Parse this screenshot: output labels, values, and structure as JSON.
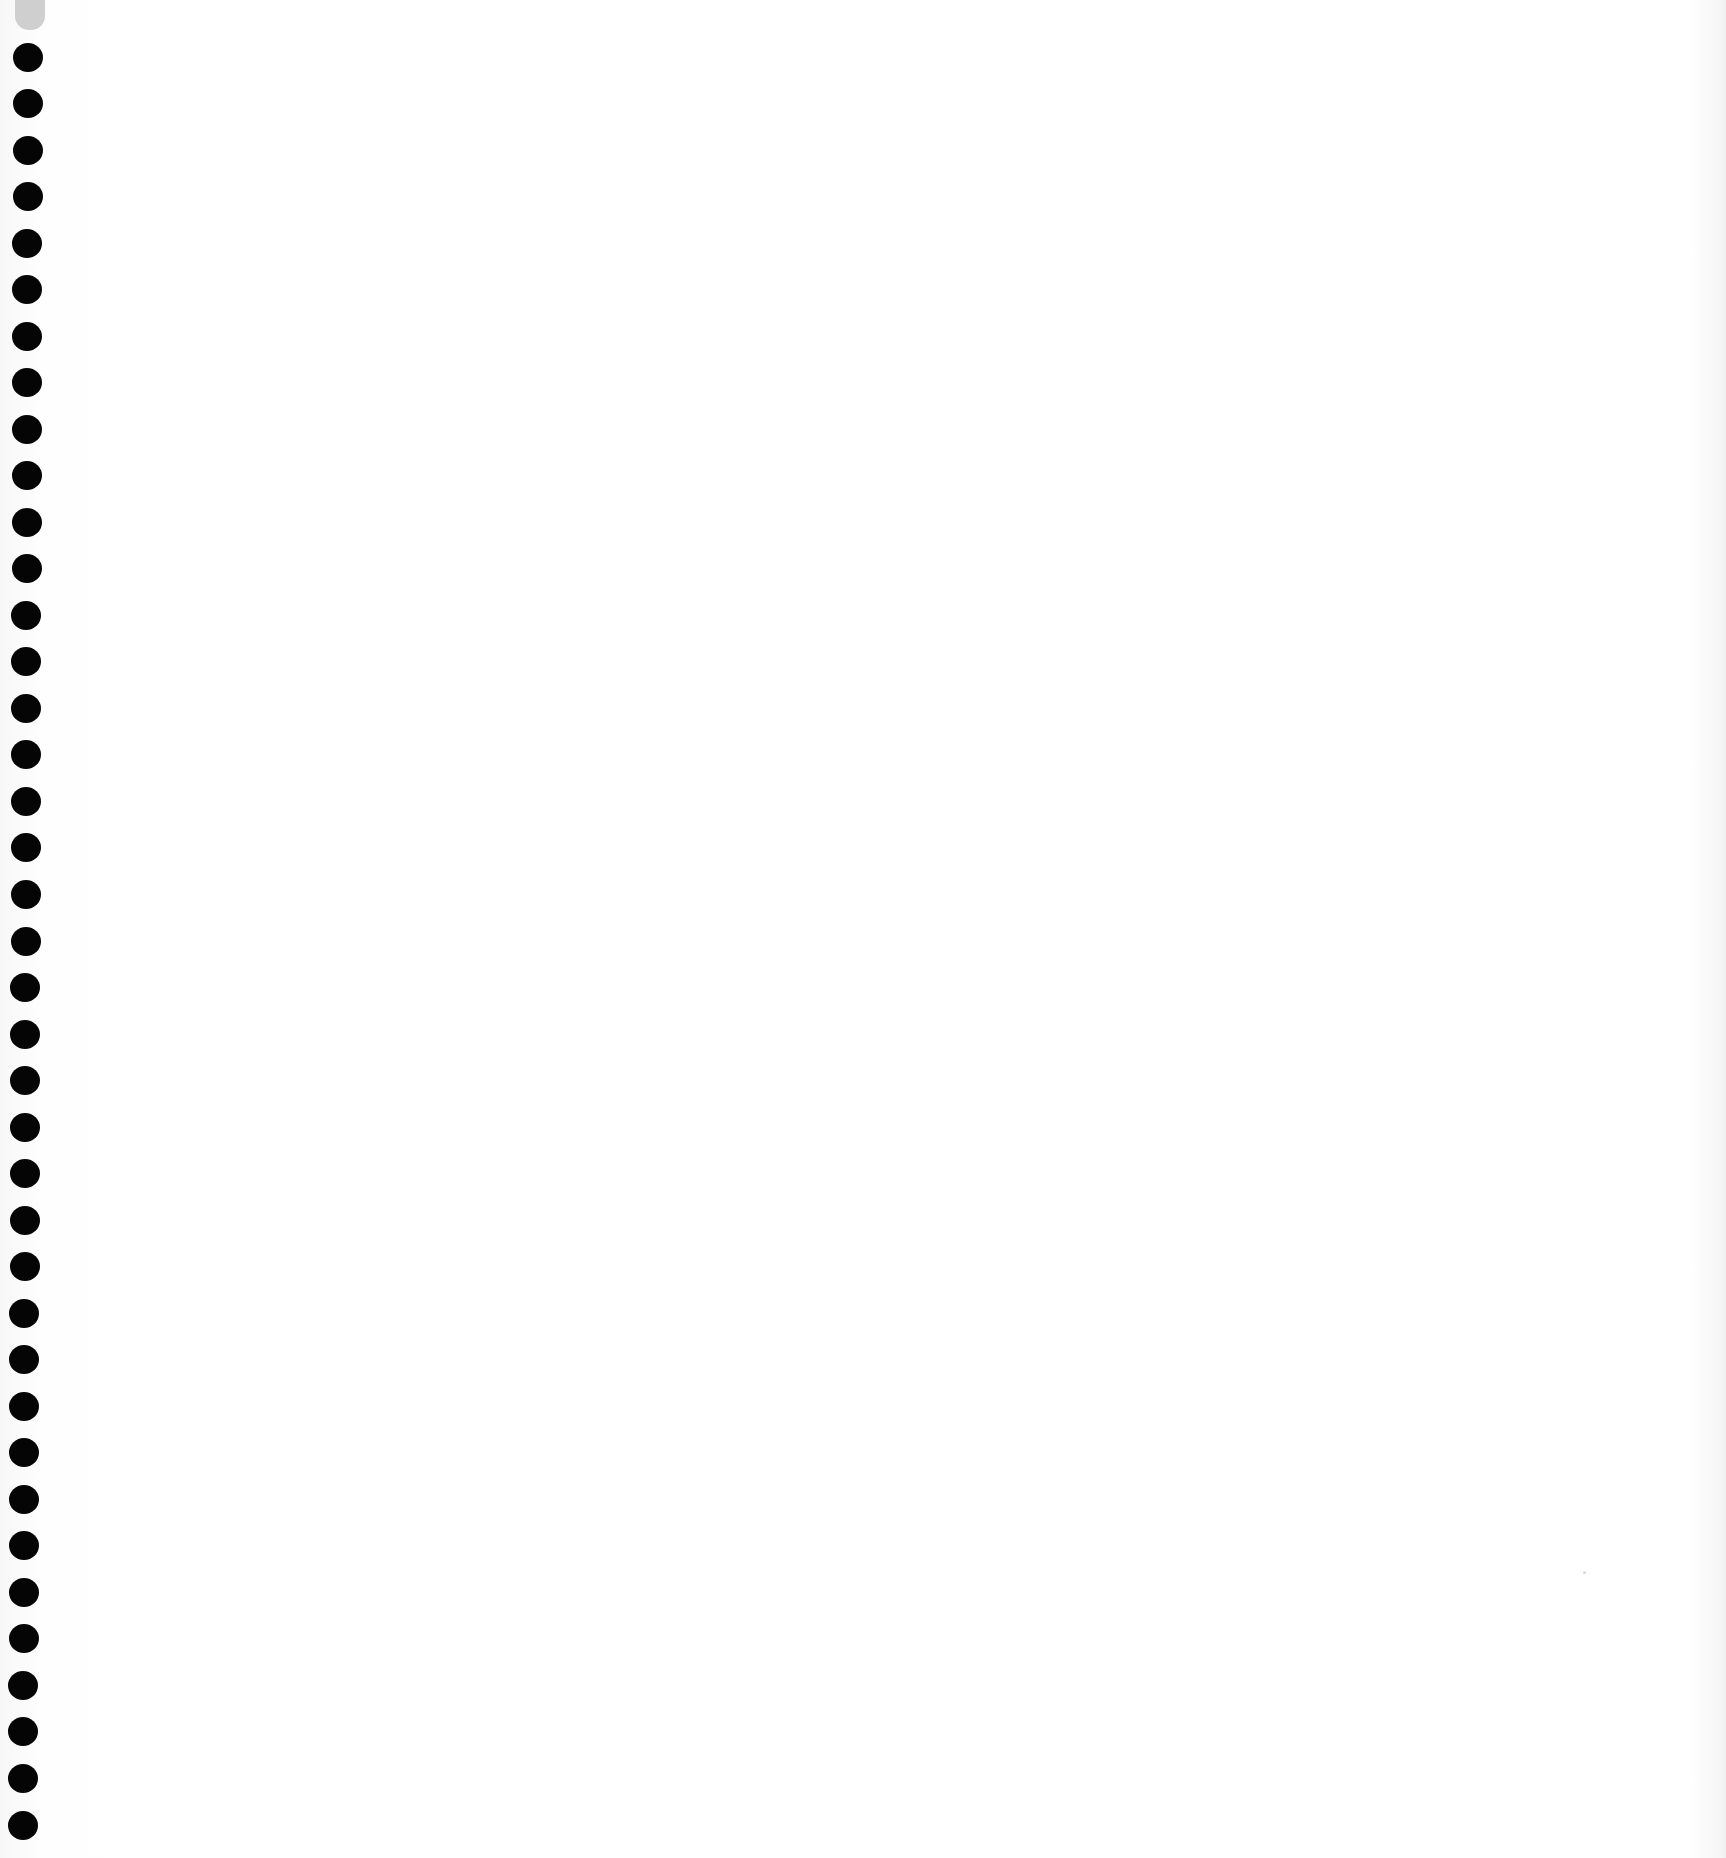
{
  "page": {
    "background_color": "#ffffff",
    "hole_color": "#050505",
    "tab_color": "#cfcfcf",
    "hole_count": 39,
    "text": ""
  }
}
